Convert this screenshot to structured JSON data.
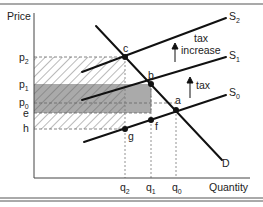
{
  "diagram": {
    "axes": {
      "y_label": "Price",
      "x_label": "Quantity"
    },
    "price_ticks": [
      {
        "id": "p2",
        "base": "p",
        "sub": "2",
        "y": 57
      },
      {
        "id": "p1",
        "base": "p",
        "sub": "1",
        "y": 84
      },
      {
        "id": "p0",
        "base": "p",
        "sub": "0",
        "y": 103
      },
      {
        "id": "e",
        "base": "e",
        "sub": "",
        "y": 113
      },
      {
        "id": "h",
        "base": "h",
        "sub": "",
        "y": 129
      }
    ],
    "quantity_ticks": [
      {
        "id": "q2",
        "base": "q",
        "sub": "2",
        "x": 125
      },
      {
        "id": "q1",
        "base": "q",
        "sub": "1",
        "x": 151
      },
      {
        "id": "q0",
        "base": "q",
        "sub": "0",
        "x": 176
      }
    ],
    "curves": [
      {
        "id": "S2",
        "base": "S",
        "sub": "2"
      },
      {
        "id": "S1",
        "base": "S",
        "sub": "1"
      },
      {
        "id": "S0",
        "base": "S",
        "sub": "0"
      },
      {
        "id": "D",
        "base": "D",
        "sub": ""
      }
    ],
    "points": [
      "a",
      "b",
      "c",
      "f",
      "g"
    ],
    "annotations": {
      "tax_increase_line1": "tax",
      "tax_increase_line2": "increase",
      "tax": "tax"
    },
    "colors": {
      "line": "#111111",
      "shade": "#a9a9a9",
      "hatch": "#666666",
      "guide": "#777777"
    }
  }
}
